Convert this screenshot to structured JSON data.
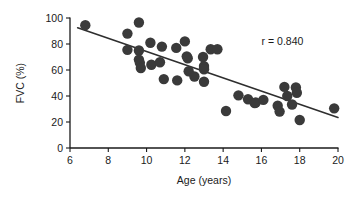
{
  "chart_data": {
    "type": "scatter",
    "title": "",
    "xlabel": "Age (years)",
    "ylabel": "FVC (%)",
    "xlim": [
      6,
      20
    ],
    "ylim": [
      0,
      100
    ],
    "xticks": [
      6,
      8,
      10,
      12,
      14,
      16,
      18,
      20
    ],
    "yticks": [
      0,
      20,
      40,
      60,
      80,
      100
    ],
    "xtick_labels": [
      "6",
      "8",
      "10",
      "12",
      "14",
      "16",
      "18",
      "20"
    ],
    "ytick_labels": [
      "0",
      "20",
      "40",
      "60",
      "80",
      "100"
    ],
    "grid": false,
    "legend": false,
    "annotations": [
      {
        "name": "correlation-annotation",
        "text": "r = 0.840",
        "x": 17.1,
        "y": 79
      }
    ],
    "series": [
      {
        "name": "FVC vs Age",
        "marker": "circle",
        "marker_color": "#3a3a3a",
        "marker_size": 5.2,
        "points": [
          [
            6.8,
            94.5
          ],
          [
            9.0,
            88.0
          ],
          [
            9.0,
            75.5
          ],
          [
            9.6,
            96.5
          ],
          [
            9.6,
            75.0
          ],
          [
            9.6,
            68.0
          ],
          [
            9.65,
            65.5
          ],
          [
            9.7,
            61.5
          ],
          [
            10.2,
            81.0
          ],
          [
            10.25,
            64.0
          ],
          [
            10.7,
            66.0
          ],
          [
            10.8,
            78.0
          ],
          [
            10.9,
            53.0
          ],
          [
            11.55,
            77.0
          ],
          [
            11.6,
            52.0
          ],
          [
            12.0,
            82.0
          ],
          [
            12.1,
            70.5
          ],
          [
            12.15,
            69.0
          ],
          [
            12.2,
            59.0
          ],
          [
            12.5,
            55.0
          ],
          [
            12.95,
            70.0
          ],
          [
            13.0,
            63.0
          ],
          [
            13.0,
            61.5
          ],
          [
            13.0,
            60.5
          ],
          [
            13.0,
            51.0
          ],
          [
            13.35,
            76.0
          ],
          [
            13.7,
            76.0
          ],
          [
            14.15,
            28.5
          ],
          [
            14.8,
            40.5
          ],
          [
            15.3,
            37.5
          ],
          [
            15.65,
            34.5
          ],
          [
            15.7,
            35.0
          ],
          [
            16.1,
            37.0
          ],
          [
            16.85,
            32.5
          ],
          [
            16.95,
            28.0
          ],
          [
            17.2,
            47.0
          ],
          [
            17.35,
            40.0
          ],
          [
            17.6,
            33.5
          ],
          [
            17.8,
            46.5
          ],
          [
            17.85,
            42.5
          ],
          [
            18.0,
            21.5
          ],
          [
            19.8,
            30.5
          ]
        ]
      }
    ],
    "fit_line": {
      "name": "regression-line",
      "x_start": 6.4,
      "y_start": 92.5,
      "x_end": 20.0,
      "y_end": 23.5,
      "color": "#2e2e2e"
    }
  }
}
